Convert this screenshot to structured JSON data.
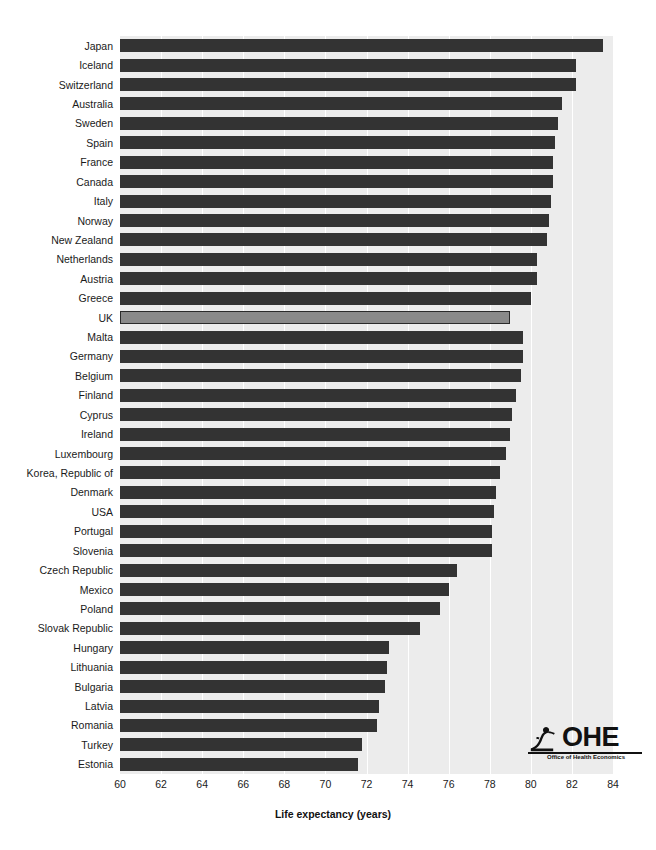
{
  "chart_data": {
    "type": "bar",
    "orientation": "horizontal",
    "title": "",
    "xlabel": "Life expectancy (years)",
    "ylabel": "",
    "xlim": [
      60,
      84
    ],
    "xticks": [
      60,
      62,
      64,
      66,
      68,
      70,
      72,
      74,
      76,
      78,
      80,
      82,
      84
    ],
    "grid": true,
    "legend": null,
    "highlight_category": "UK",
    "colors": {
      "bar": "#333333",
      "highlight_bar": "#8a8a8a",
      "highlight_edge": "#2b2b2b",
      "plot_background": "#ececec",
      "gridline": "#ffffff",
      "text": "#1a1a1a"
    },
    "categories": [
      "Japan",
      "Iceland",
      "Switzerland",
      "Australia",
      "Sweden",
      "Spain",
      "France",
      "Canada",
      "Italy",
      "Norway",
      "New Zealand",
      "Netherlands",
      "Austria",
      "Greece",
      "UK",
      "Malta",
      "Germany",
      "Belgium",
      "Finland",
      "Cyprus",
      "Ireland",
      "Luxembourg",
      "Korea, Republic of",
      "Denmark",
      "USA",
      "Portugal",
      "Slovenia",
      "Czech Republic",
      "Mexico",
      "Poland",
      "Slovak Republic",
      "Hungary",
      "Lithuania",
      "Bulgaria",
      "Latvia",
      "Romania",
      "Turkey",
      "Estonia"
    ],
    "values": [
      83.5,
      82.2,
      82.2,
      81.5,
      81.3,
      81.2,
      81.1,
      81.1,
      81.0,
      80.9,
      80.8,
      80.3,
      80.3,
      80.0,
      79.0,
      79.6,
      79.6,
      79.5,
      79.3,
      79.1,
      79.0,
      78.8,
      78.5,
      78.3,
      78.2,
      78.1,
      78.1,
      76.4,
      76.0,
      75.6,
      74.6,
      73.1,
      73.0,
      72.9,
      72.6,
      72.5,
      71.8,
      71.6
    ],
    "bar_count": 38
  },
  "axis": {
    "x_title_text": "Life expectancy (years)"
  },
  "logo": {
    "wordmark": "OHE",
    "tagline": "Office of Health Economics",
    "icon_name": "ohe-figure-icon"
  }
}
